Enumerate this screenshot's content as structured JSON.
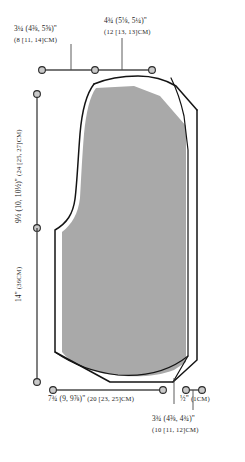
{
  "diagram": {
    "kind": "sewing-pattern-schematic",
    "piece_fill_color": "#a9a9a9",
    "outline_color": "#141414",
    "ruler_color": "#4a4a4a",
    "background_color": "#ffffff",
    "marker_fill_color": "#c9c9c9"
  },
  "measurements": {
    "top_left": {
      "inches": "3¼ (4⅜, 5⅝)\"",
      "cm": "(8 [11, 14]CM)"
    },
    "top_right": {
      "inches": "4¾ (5⅛, 5¼)\"",
      "cm": "(12 [13, 13]CM)"
    },
    "left_upper": {
      "inches": "9½ (10, 10½)\"",
      "cm": "(24 [25, 27]CM)"
    },
    "left_lower": {
      "inches": "14\"",
      "cm": "(36CM)"
    },
    "bottom_left": {
      "inches": "7¾ (9, 9⅞)\"",
      "cm": "(20 [23, 25]CM)"
    },
    "bottom_right_small": {
      "inches": "½\"",
      "cm": "(1CM)"
    },
    "bottom_right": {
      "inches": "3¾ (4⅜, 4¾)\"",
      "cm": "(10 [11, 12]CM)"
    }
  }
}
